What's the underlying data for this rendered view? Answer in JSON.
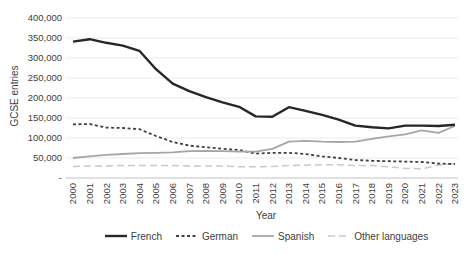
{
  "chart_data": {
    "type": "line",
    "title": "",
    "xlabel": "Year",
    "ylabel": "GCSE entries",
    "ylim": [
      0,
      400000
    ],
    "ytick_step": 50000,
    "ytick_labels": [
      "-",
      "50,000",
      "100,000",
      "150,000",
      "200,000",
      "250,000",
      "300,000",
      "350,000",
      "400,000"
    ],
    "grid": "horizontal",
    "legend_position": "bottom",
    "grid_color": "#ebebeb",
    "axis_line_color": "#c2c2c2",
    "categories": [
      "2000",
      "2001",
      "2002",
      "2003",
      "2004",
      "2005",
      "2006",
      "2007",
      "2008",
      "2009",
      "2010",
      "2011",
      "2012",
      "2013",
      "2014",
      "2015",
      "2016",
      "2017",
      "2018",
      "2019",
      "2020",
      "2021",
      "2022",
      "2023"
    ],
    "series": [
      {
        "name": "Other languages",
        "color": "#c9c9c9",
        "dash": "7,4",
        "width": 1.5,
        "values": [
          29000,
          30000,
          30000,
          31000,
          31000,
          31000,
          31000,
          30000,
          30000,
          30000,
          28000,
          28000,
          29000,
          31000,
          32000,
          33000,
          33000,
          31000,
          31000,
          28000,
          24000,
          23000,
          32000,
          36000
        ]
      },
      {
        "name": "German",
        "color": "#404040",
        "dash": "3,2.5",
        "width": 1.8,
        "values": [
          134000,
          135000,
          126000,
          125000,
          122000,
          105000,
          90000,
          81000,
          77000,
          73000,
          70000,
          61000,
          63000,
          63000,
          60000,
          54000,
          50000,
          45000,
          43000,
          42000,
          41000,
          40000,
          36000,
          35000
        ]
      },
      {
        "name": "Spanish",
        "color": "#a6a6a6",
        "dash": "solid",
        "width": 1.8,
        "values": [
          50000,
          54000,
          58000,
          60000,
          62000,
          63000,
          64000,
          67000,
          68000,
          67000,
          66000,
          66000,
          73000,
          91000,
          93000,
          91000,
          90000,
          91000,
          98000,
          104000,
          109000,
          119000,
          113000,
          130000
        ]
      },
      {
        "name": "French",
        "color": "#262626",
        "dash": "solid",
        "width": 2.4,
        "values": [
          341000,
          347000,
          338000,
          331000,
          318000,
          272000,
          236000,
          217000,
          202000,
          189000,
          178000,
          154000,
          153000,
          177000,
          168000,
          158000,
          146000,
          131000,
          127000,
          124000,
          131000,
          131000,
          130000,
          133000
        ]
      }
    ],
    "legend_order": [
      "French",
      "German",
      "Spanish",
      "Other languages"
    ]
  }
}
